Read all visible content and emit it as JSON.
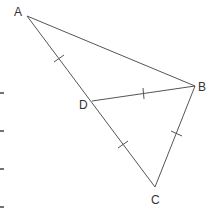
{
  "diagram": {
    "stroke_color": "#555555",
    "vertices": {
      "A": {
        "label": "A",
        "x": 27,
        "y": 16
      },
      "B": {
        "label": "B",
        "x": 195,
        "y": 86
      },
      "C": {
        "label": "C",
        "x": 155,
        "y": 187
      },
      "D": {
        "label": "D",
        "x": 92,
        "y": 101
      }
    },
    "segments": [
      "AB",
      "AC",
      "BC",
      "DB"
    ],
    "equal_marks": [
      "AD",
      "DB",
      "DC",
      "BC"
    ],
    "labels": {
      "A": "A",
      "B": "B",
      "C": "C",
      "D": "D"
    },
    "edge_dashes_y": [
      93,
      131,
      169,
      207
    ]
  }
}
